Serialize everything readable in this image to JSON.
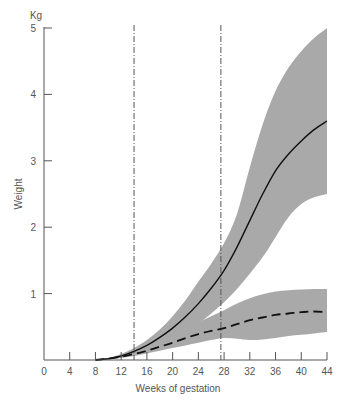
{
  "chart_data": {
    "type": "area",
    "title": "",
    "xlabel": "Weeks of gestation",
    "ylabel": "Weight",
    "yunit": "Kg",
    "xlim": [
      0,
      44
    ],
    "ylim": [
      0,
      5
    ],
    "x_ticks": [
      0,
      4,
      8,
      12,
      16,
      20,
      24,
      28,
      32,
      36,
      40,
      44
    ],
    "y_ticks": [
      1,
      2,
      3,
      4,
      5
    ],
    "grid": false,
    "legend": null,
    "reference_lines": [
      {
        "orientation": "vertical",
        "x": 14,
        "style": "dashed"
      },
      {
        "orientation": "vertical",
        "x": 27.5,
        "style": "dashed"
      }
    ],
    "series": [
      {
        "name": "Mean weight (solid)",
        "style": "solid",
        "x": [
          8,
          10,
          12,
          14,
          16,
          18,
          20,
          22,
          24,
          26,
          28,
          30,
          32,
          34,
          36,
          38,
          40,
          42,
          44
        ],
        "values": [
          0.0,
          0.02,
          0.06,
          0.13,
          0.22,
          0.34,
          0.48,
          0.65,
          0.85,
          1.08,
          1.35,
          1.7,
          2.1,
          2.5,
          2.85,
          3.1,
          3.3,
          3.47,
          3.6
        ],
        "band_upper": [
          0.0,
          0.03,
          0.09,
          0.18,
          0.3,
          0.46,
          0.66,
          0.9,
          1.18,
          1.45,
          1.76,
          2.2,
          2.9,
          3.55,
          4.05,
          4.4,
          4.65,
          4.85,
          5.0
        ],
        "band_lower": [
          0.0,
          0.01,
          0.04,
          0.09,
          0.16,
          0.24,
          0.33,
          0.43,
          0.55,
          0.7,
          0.87,
          1.07,
          1.3,
          1.55,
          1.85,
          2.15,
          2.35,
          2.45,
          2.5
        ]
      },
      {
        "name": "Mean weight (dashed)",
        "style": "dashed",
        "x": [
          8,
          10,
          12,
          14,
          16,
          18,
          20,
          22,
          24,
          26,
          28,
          30,
          32,
          34,
          36,
          38,
          40,
          42,
          44
        ],
        "values": [
          0.0,
          0.02,
          0.05,
          0.09,
          0.14,
          0.2,
          0.26,
          0.33,
          0.39,
          0.44,
          0.48,
          0.54,
          0.6,
          0.64,
          0.68,
          0.7,
          0.72,
          0.73,
          0.72
        ],
        "band_upper": [
          0.0,
          0.03,
          0.07,
          0.13,
          0.2,
          0.28,
          0.37,
          0.47,
          0.57,
          0.66,
          0.75,
          0.85,
          0.93,
          0.99,
          1.03,
          1.05,
          1.06,
          1.07,
          1.07
        ],
        "band_lower": [
          0.0,
          0.01,
          0.03,
          0.06,
          0.1,
          0.14,
          0.18,
          0.22,
          0.26,
          0.3,
          0.33,
          0.32,
          0.3,
          0.31,
          0.33,
          0.36,
          0.38,
          0.4,
          0.42
        ]
      }
    ],
    "colors": {
      "band": "#a9a9a9",
      "line": "#111111",
      "axis": "#555555",
      "reference_line": "#555555"
    }
  }
}
